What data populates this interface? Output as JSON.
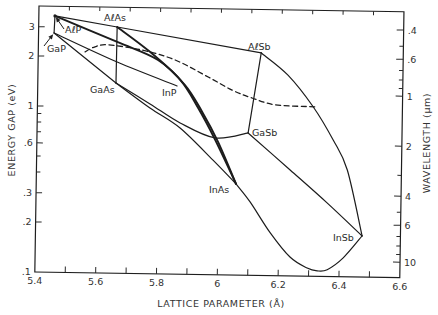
{
  "figure": {
    "x_axis_title": "LATTICE PARAMETER (Å)",
    "y_axis_left_title": "ENERGY GAP (eV)",
    "y_axis_right_title": "WAVELENGTH (μm)"
  },
  "chart_data": {
    "type": "line",
    "title": "",
    "xlabel": "LATTICE PARAMETER (Å)",
    "ylabel": "ENERGY GAP (eV)",
    "y2label": "WAVELENGTH (μm)",
    "xlim": [
      5.4,
      6.6
    ],
    "ylim": [
      0.1,
      4.0
    ],
    "yscale": "log",
    "y2_relation": "wavelength_um = 1.24 / energy_eV",
    "grid": false,
    "legend": null,
    "x_ticks": [
      {
        "value": 5.4,
        "label": "5.4"
      },
      {
        "value": 5.6,
        "label": "5.6"
      },
      {
        "value": 5.8,
        "label": "5.8"
      },
      {
        "value": 6.0,
        "label": "6"
      },
      {
        "value": 6.2,
        "label": "6.2"
      },
      {
        "value": 6.4,
        "label": "6.4"
      },
      {
        "value": 6.6,
        "label": "6.6"
      }
    ],
    "x_minor_ticks": [
      5.5,
      5.7,
      5.9,
      6.1,
      6.3,
      6.5
    ],
    "y_ticks": [
      {
        "value": 3,
        "label": "3"
      },
      {
        "value": 2,
        "label": "2"
      },
      {
        "value": 1,
        "label": "1"
      },
      {
        "value": 0.6,
        "label": ".6"
      },
      {
        "value": 0.3,
        "label": ".3"
      },
      {
        "value": 0.2,
        "label": ".2"
      },
      {
        "value": 0.1,
        "label": ".1"
      }
    ],
    "y_minor_ticks": [
      0.9,
      0.8,
      0.7,
      0.5,
      0.4
    ],
    "y2_ticks": [
      {
        "value": 0.4,
        "label": ".4"
      },
      {
        "value": 0.6,
        "label": ".6"
      },
      {
        "value": 1,
        "label": "1"
      },
      {
        "value": 2,
        "label": "2"
      },
      {
        "value": 4,
        "label": "4"
      },
      {
        "value": 6,
        "label": "6"
      },
      {
        "value": 10,
        "label": "10"
      }
    ],
    "y2_minor_ticks": [
      0.5,
      0.7,
      0.8,
      0.9,
      3,
      5,
      7,
      8,
      9
    ],
    "compounds": [
      {
        "id": "AlP",
        "label": "AℓP",
        "a": 5.453,
        "eg": 3.5,
        "label_xy": [
          65,
          33
        ],
        "arrow_from": [
          64,
          29
        ]
      },
      {
        "id": "GaP",
        "label": "GaP",
        "a": 5.451,
        "eg": 2.76,
        "label_xy": [
          47,
          52
        ],
        "arrow_from": [
          44,
          46
        ]
      },
      {
        "id": "AlAs",
        "label": "AℓAs",
        "a": 5.658,
        "eg": 3.04,
        "label_xy": [
          104,
          21
        ]
      },
      {
        "id": "GaAs",
        "label": "GaAs",
        "a": 5.657,
        "eg": 1.4,
        "label_xy": [
          90,
          93
        ]
      },
      {
        "id": "InP",
        "label": "InP",
        "a": 5.858,
        "eg": 1.36,
        "label_xy": [
          162,
          96
        ]
      },
      {
        "id": "AlSb",
        "label": "AℓSb",
        "a": 6.133,
        "eg": 2.19,
        "label_xy": [
          248,
          50
        ]
      },
      {
        "id": "GaSb",
        "label": "GaSb",
        "a": 6.094,
        "eg": 0.72,
        "label_xy": [
          252,
          136
        ]
      },
      {
        "id": "InAs",
        "label": "InAs",
        "a": 6.057,
        "eg": 0.354,
        "label_xy": [
          209,
          193
        ]
      },
      {
        "id": "InSb",
        "label": "InSb",
        "a": 6.474,
        "eg": 0.177,
        "label_xy": [
          333,
          241
        ]
      }
    ],
    "series": [
      {
        "name": "AlP-GaP",
        "style": "solid",
        "x": [
          5.453,
          5.451
        ],
        "y": [
          3.5,
          2.76
        ]
      },
      {
        "name": "AlP-AlAs",
        "style": "solid",
        "x": [
          5.453,
          5.658
        ],
        "y": [
          3.5,
          3.04
        ]
      },
      {
        "name": "AlAs-AlSb",
        "style": "solid",
        "x": [
          5.658,
          6.133
        ],
        "y": [
          3.04,
          2.19
        ]
      },
      {
        "name": "AlAs-GaAs",
        "style": "solid",
        "x": [
          5.658,
          5.657
        ],
        "y": [
          3.04,
          1.4
        ]
      },
      {
        "name": "GaP-GaAs",
        "style": "solid",
        "x": [
          5.451,
          5.657
        ],
        "y": [
          2.76,
          1.4
        ]
      },
      {
        "name": "GaP-InP",
        "style": "solid",
        "x": [
          5.451,
          5.66,
          5.858
        ],
        "y": [
          2.76,
          1.87,
          1.36
        ]
      },
      {
        "name": "AlP-InAs",
        "style": "thick",
        "x": [
          5.453,
          5.659,
          5.794,
          5.884,
          5.942,
          5.996,
          6.057
        ],
        "y": [
          3.5,
          2.47,
          1.94,
          1.38,
          0.954,
          0.63,
          0.354
        ]
      },
      {
        "name": "AlAs-InAs",
        "style": "thick",
        "x": [
          5.658,
          5.767,
          5.868,
          5.928,
          5.986,
          6.057
        ],
        "y": [
          3.04,
          2.17,
          1.48,
          1.01,
          0.65,
          0.354
        ]
      },
      {
        "name": "GaAs-GaSb",
        "style": "solid",
        "x": [
          5.657,
          5.77,
          5.87,
          5.986,
          6.094
        ],
        "y": [
          1.4,
          1.054,
          0.815,
          0.667,
          0.72
        ]
      },
      {
        "name": "GaAs-InAs",
        "style": "solid",
        "x": [
          5.657,
          5.77,
          5.87,
          5.98,
          6.057
        ],
        "y": [
          1.4,
          0.997,
          0.76,
          0.49,
          0.354
        ]
      },
      {
        "name": "AlSb-GaSb",
        "style": "solid",
        "x": [
          6.133,
          6.094
        ],
        "y": [
          2.19,
          0.72
        ]
      },
      {
        "name": "AlSb-InSb",
        "style": "solid",
        "x": [
          6.133,
          6.222,
          6.307,
          6.374,
          6.422,
          6.474
        ],
        "y": [
          2.19,
          1.62,
          1.047,
          0.665,
          0.44,
          0.177
        ]
      },
      {
        "name": "GaSb-InSb",
        "style": "solid",
        "x": [
          6.094,
          6.234,
          6.358,
          6.474
        ],
        "y": [
          0.72,
          0.435,
          0.277,
          0.177
        ]
      },
      {
        "name": "InAs-InSb",
        "style": "solid",
        "x": [
          6.057,
          6.104,
          6.172,
          6.238,
          6.295,
          6.328,
          6.361,
          6.413,
          6.474
        ],
        "y": [
          0.354,
          0.277,
          0.181,
          0.13,
          0.112,
          0.108,
          0.11,
          0.13,
          0.177
        ]
      },
      {
        "name": "direct-indirect boundary",
        "style": "dashed",
        "x": [
          5.554,
          5.586,
          5.629,
          5.741,
          5.85,
          5.96,
          6.039,
          6.105,
          6.182,
          6.313
        ],
        "y": [
          2.14,
          2.3,
          2.37,
          2.22,
          1.95,
          1.55,
          1.3,
          1.17,
          1.07,
          1.05
        ]
      }
    ]
  }
}
